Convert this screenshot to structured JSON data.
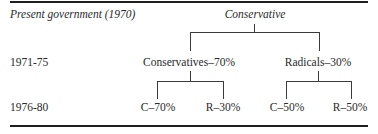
{
  "header": {
    "row_label": "Present government (1970)",
    "root": "Conservative"
  },
  "rows": [
    {
      "label": "1971-75",
      "nodes": [
        "Conservatives–70%",
        "Radicals–30%"
      ]
    },
    {
      "label": "1976-80",
      "nodes": [
        "C–70%",
        "R–30%",
        "C–50%",
        "R–50%"
      ]
    }
  ],
  "colors": {
    "text": "#2a2a2a",
    "lines": "#3a3a3a",
    "rules": "#1e1e1e"
  }
}
